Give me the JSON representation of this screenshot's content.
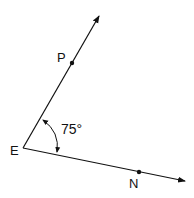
{
  "diagram": {
    "type": "angle",
    "vertex": {
      "label": "E",
      "x": 23,
      "y": 148
    },
    "rays": [
      {
        "name": "EP",
        "point": {
          "label": "P",
          "x": 72,
          "y": 63
        },
        "end": {
          "x": 100,
          "y": 14
        }
      },
      {
        "name": "EN",
        "point": {
          "label": "N",
          "x": 139,
          "y": 173
        },
        "end": {
          "x": 186,
          "y": 181
        }
      }
    ],
    "angle": {
      "label": "75°",
      "value": 75,
      "between": [
        "EP",
        "EN"
      ]
    },
    "colors": {
      "stroke": "#111111",
      "background": "#ffffff"
    }
  }
}
